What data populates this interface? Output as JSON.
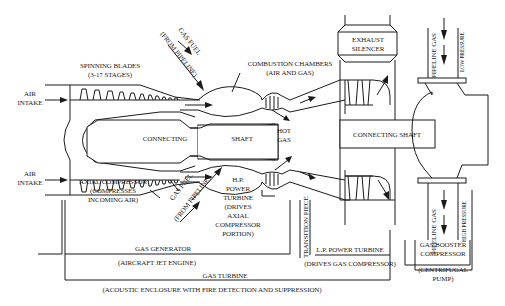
{
  "diagram": {
    "labels": {
      "spinning_blades_1": "SPINNING BLADES",
      "spinning_blades_2": "(3-17 STAGES)",
      "air_intake_top_1": "AIR",
      "air_intake_top_2": "INTAKE",
      "air_intake_bottom_1": "AIR",
      "air_intake_bottom_2": "INTAKE",
      "gas_fuel_top_1": "GAS FUEL",
      "gas_fuel_top_2": "(FROM PIPELINE)",
      "combustion_1": "COMBUSTION CHAMBERS",
      "combustion_2": "(AIR AND GAS)",
      "exhaust_1": "EXHAUST",
      "exhaust_2": "SILENCER",
      "pipeline_gas_top": "PIPELINE GAS",
      "low_pressure": "LOW PRESSURE",
      "connecting": "CONNECTING",
      "shaft": "SHAFT",
      "hot_gas_1": "HOT",
      "hot_gas_2": "GAS",
      "connecting_shaft": "CONNECTING SHAFT",
      "axial_1": "AXIAL COMPRESSOR",
      "axial_2": "(COMPRESSES",
      "axial_3": "INCOMING AIR)",
      "gas_fuel_bottom_1": "GAS FUEL",
      "gas_fuel_bottom_2": "(FROM PIPELINE)",
      "hp_1": "H.P.",
      "hp_2": "POWER",
      "hp_3": "TURBINE",
      "hp_4": "(DRIVES",
      "hp_5": "AXIAL",
      "hp_6": "COMPRESSOR",
      "hp_7": "PORTION)",
      "transition_piece": "TRANSITION PIECE",
      "pipeline_gas_bottom": "PIPELINE GAS",
      "high_pressure": "HIGH PRESSURE",
      "gas_generator": "GAS GENERATOR",
      "aircraft_jet": "(AIRCRAFT JET ENGINE)",
      "lp_turbine": "L.P. POWER TURBINE",
      "drives_gas_comp": "(DRIVES GAS COMPRESSOR)",
      "booster_1": "GAS BOOSTER",
      "booster_2": "COMPRESSOR",
      "centrifugal_1": "(CENTRIFUGAL",
      "centrifugal_2": "PUMP)",
      "gas_turbine": "GAS TURBINE",
      "acoustic": "(ACOUSTIC ENCLOSURE WITH FIRE DETECTION AND SUPPRESSION)"
    },
    "colors": {
      "ink": "#1a1a1a",
      "background": "#ffffff"
    }
  }
}
